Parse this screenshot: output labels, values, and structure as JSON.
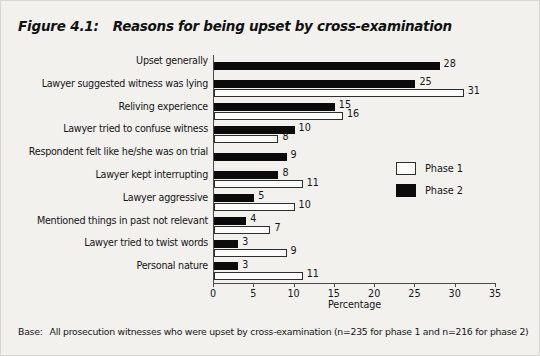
{
  "figure": {
    "number": "Figure 4.1:",
    "title": "Reasons for being upset by cross-examination",
    "base_note_lead": "Base:",
    "base_note_text": "All prosecution witnesses who were upset by cross-examination (n=235 for phase 1 and n=216 for phase 2)"
  },
  "legend": {
    "position": "inside-right",
    "items": [
      {
        "label": "Phase 1",
        "swatch": "white-outlined-square",
        "color": "#ffffff"
      },
      {
        "label": "Phase 2",
        "swatch": "black-filled-square",
        "color": "#0b0b0b"
      }
    ]
  },
  "axis": {
    "x_title": "Percentage",
    "x_ticks": [
      "0",
      "5",
      "10",
      "15",
      "20",
      "25",
      "30",
      "35"
    ]
  },
  "chart_data": {
    "type": "bar",
    "orientation": "horizontal",
    "title": "Reasons for being upset by cross-examination",
    "xlabel": "Percentage",
    "ylabel": "",
    "xlim": [
      0,
      35
    ],
    "xtick_step": 5,
    "grid": false,
    "legend_position": "inside-right",
    "categories": [
      "Upset generally",
      "Lawyer suggested witness was lying",
      "Reliving experience",
      "Lawyer tried to confuse witness",
      "Respondent felt like he/she was on trial",
      "Lawyer kept interrupting",
      "Lawyer aggressive",
      "Mentioned things in past not relevant",
      "Lawyer tried to twist words",
      "Personal nature"
    ],
    "series": [
      {
        "name": "Phase 1",
        "color": "#ffffff",
        "values": [
          null,
          31,
          16,
          8,
          null,
          11,
          10,
          7,
          9,
          11
        ]
      },
      {
        "name": "Phase 2",
        "color": "#0b0b0b",
        "values": [
          28,
          25,
          15,
          10,
          9,
          8,
          5,
          4,
          3,
          3
        ]
      }
    ]
  }
}
